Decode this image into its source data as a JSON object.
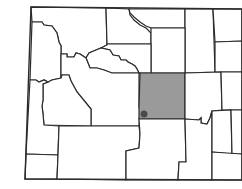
{
  "map": {
    "region": "Wyoming",
    "highlighted_county": "Natrona",
    "colors": {
      "county_fill": "#ffffff",
      "highlight_fill": "#9a9a9a",
      "border": "#2b2b2b",
      "dot": "#4a4a4a"
    },
    "state_outline": "M31,7 L242,9 L242,180 L25,179 Z",
    "counties": [
      {
        "name": "Park",
        "d": "M31,7 L106,8 L107,45 L101,48 L96,50 L89,53 L86,58 L80,54 L76,53 L74,57 L67,57 L67,54 L61,54 L61,46 L59,42 L57,33 L52,26 L44,25 L42,22 L32,22 Z"
      },
      {
        "name": "Big Horn",
        "d": "M106,8 L129,9 L130,15 L134,20 L140,25 L146,28 L151,33 L151,44 L107,44 Z"
      },
      {
        "name": "Sheridan",
        "d": "M129,9 L185,9 L185,28 L151,28 L146,26 L140,22 L134,17 L130,13 Z"
      },
      {
        "name": "Campbell",
        "d": "M185,9 L213,9 L215,72 L185,73 Z"
      },
      {
        "name": "Crook",
        "d": "M213,9 L242,9 L242,41 L215,42 Z"
      },
      {
        "name": "Weston",
        "d": "M215,42 L242,41 L242,72 L215,72 Z"
      },
      {
        "name": "Johnson",
        "d": "M151,28 L185,28 L185,73 L151,73 Z"
      },
      {
        "name": "Washakie",
        "d": "M107,44 L151,44 L151,73 L139,73 L137,69 L135,66 L132,64 L128,62 L126,60 L121,60 L119,56 L113,55 L110,50 L101,48 L107,45 Z"
      },
      {
        "name": "Hot Springs",
        "d": "M86,58 L89,53 L96,50 L101,48 L110,50 L113,55 L119,56 L121,60 L126,60 L128,62 L132,64 L135,66 L137,69 L139,73 L112,73 L104,70 L97,68 L90,68 Z"
      },
      {
        "name": "Teton",
        "d": "M32,22 L42,22 L44,25 L52,26 L57,33 L59,42 L61,46 L61,54 L61,78 L52,80 L48,82 L44,80 L39,82 L36,80 L30,80 Z"
      },
      {
        "name": "Fremont",
        "d": "M61,54 L67,54 L67,57 L74,57 L76,53 L80,54 L86,58 L90,68 L97,68 L104,70 L112,73 L139,73 L139,107 L140,110 L139,126 L91,126 L91,109 L77,92 L71,81 L69,75 L62,75 L61,78 Z"
      },
      {
        "name": "Sublette",
        "d": "M61,78 L62,75 L69,75 L71,81 L77,92 L91,109 L91,126 L44,125 L43,114 L42,106 L43,100 L43,84 L48,82 L52,80 Z"
      },
      {
        "name": "Lincoln",
        "d": "M30,80 L36,80 L39,82 L44,80 L48,82 L43,84 L43,100 L42,106 L43,114 L44,125 L59,126 L58,155 L26,154 Z"
      },
      {
        "name": "Uinta",
        "d": "M26,154 L58,155 L57,179 L25,179 Z"
      },
      {
        "name": "Sweetwater",
        "d": "M59,126 L139,126 L140,134 L139,148 L126,151 L126,180 L57,179 L58,155 Z"
      },
      {
        "name": "Natrona",
        "d": "M140,73 L185,73 L185,119 L139,119 L139,107 Z",
        "highlight": true
      },
      {
        "name": "Carbon",
        "d": "M139,119 L185,119 L186,162 L179,162 L178,180 L126,180 L126,151 L139,148 L140,134 Z"
      },
      {
        "name": "Converse",
        "d": "M185,73 L221,72 L222,110 L212,111 L210,118 L207,124 L201,123 L201,118 L199,120 L185,119 Z"
      },
      {
        "name": "Niobrara",
        "d": "M221,72 L242,72 L242,110 L222,110 Z"
      },
      {
        "name": "Albany",
        "d": "M185,119 L199,120 L201,118 L201,123 L207,124 L210,118 L212,111 L212,151 L212,180 L178,180 L179,162 L186,162 Z"
      },
      {
        "name": "Platte",
        "d": "M212,111 L231,110 L232,154 L212,152 Z"
      },
      {
        "name": "Goshen",
        "d": "M231,110 L242,110 L242,154 L232,154 Z"
      },
      {
        "name": "Laramie",
        "d": "M212,152 L242,154 L242,180 L212,180 Z"
      }
    ],
    "city_marker": {
      "name": "Casper",
      "cx": 144,
      "cy": 114,
      "r": 3.5
    }
  }
}
